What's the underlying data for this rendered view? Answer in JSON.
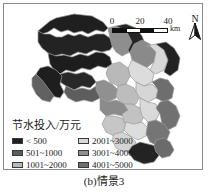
{
  "figure": {
    "caption": "(b)情景3"
  },
  "scalebar": {
    "ticks": [
      "0",
      "20",
      "40"
    ],
    "unit": "km",
    "segments": [
      "on",
      "off",
      "on",
      "off"
    ]
  },
  "north_arrow": {
    "letter": "N",
    "icon": "north-arrow-icon"
  },
  "legend": {
    "title": "节水投入/万元",
    "items": [
      {
        "label": "< 500",
        "color": "#201f1f"
      },
      {
        "label": "501~1000",
        "color": "#5d5d5d"
      },
      {
        "label": "1001~2000",
        "color": "#b9b9b9"
      },
      {
        "label": "2001~3000",
        "color": "#d8d8d8"
      },
      {
        "label": "3001~4000",
        "color": "#8e8e8e"
      },
      {
        "label": "4001~5000",
        "color": "#6e6e6e"
      }
    ]
  },
  "map": {
    "name": "water-saving-investment-choropleth",
    "outline_color": "#9a9a9a",
    "regions": [
      {
        "id": "r1",
        "class": "< 500",
        "fill": "#201f1f",
        "points": "52,14 70,10 88,12 99,18 104,24 100,28 92,26 84,30 78,27 70,29 64,26 57,28 50,24 44,28 38,30 34,27 40,22 46,17"
      },
      {
        "id": "r2",
        "class": "< 500",
        "fill": "#242323",
        "points": "34,27 40,30 46,30 52,33 58,33 64,30 70,32 76,30 84,33 92,30 100,30 106,34 110,40 106,46 98,48 90,46 82,50 74,48 66,52 58,50 50,52 44,49 38,44 34,38"
      },
      {
        "id": "r3",
        "class": "< 500",
        "fill": "#1e1d1d",
        "points": "44,49 52,52 60,51 68,53 76,50 84,52 92,48 100,49 106,53 108,60 102,64 94,62 86,66 78,64 70,68 62,66 56,70 50,66 46,60"
      },
      {
        "id": "r4",
        "class": "3001~4000",
        "fill": "#8e8e8e",
        "points": "104,24 112,22 120,26 126,32 130,40 126,48 118,52 112,48 108,42 106,34"
      },
      {
        "id": "r5",
        "class": "< 500",
        "fill": "#262525",
        "points": "112,22 122,20 132,24 138,32 142,42 136,50 128,52 124,46 128,38 124,30 118,25"
      },
      {
        "id": "r6",
        "class": "3001~4000",
        "fill": "#8a8a8a",
        "points": "130,40 138,36 146,40 152,48 150,58 142,64 134,62 128,56 126,48"
      },
      {
        "id": "r7",
        "class": "2001~3000",
        "fill": "#d8d8d8",
        "points": "142,42 152,40 160,46 164,56 160,66 152,70 146,66 150,58 152,48 146,42"
      },
      {
        "id": "r8",
        "class": "< 500",
        "fill": "#232222",
        "points": "152,40 162,38 170,44 176,54 174,66 166,72 160,68 164,56 160,46"
      },
      {
        "id": "r9",
        "class": "2001~3000",
        "fill": "#dcdcdc",
        "points": "128,56 136,60 144,64 150,70 148,78 140,82 132,78 126,72 124,64"
      },
      {
        "id": "r10",
        "class": "1001~2000",
        "fill": "#b9b9b9",
        "points": "108,60 116,58 124,64 126,72 122,80 114,82 106,78 102,70 104,64"
      },
      {
        "id": "r11",
        "class": "< 500",
        "fill": "#292828",
        "points": "56,70 64,68 72,70 80,68 88,72 92,78 86,84 78,82 70,86 62,82 56,78"
      },
      {
        "id": "r12",
        "class": "501~1000",
        "fill": "#5d5d5d",
        "points": "62,82 70,86 78,84 86,86 92,82 98,86 96,94 88,98 80,96 72,98 64,94 60,88"
      },
      {
        "id": "r13",
        "class": "< 500",
        "fill": "#1f1e1e",
        "points": "36,64 44,62 52,66 58,72 56,80 60,88 56,94 48,92 42,86 36,78 32,70"
      },
      {
        "id": "r14",
        "class": "501~1000",
        "fill": "#616161",
        "points": "32,70 38,76 44,84 50,92 46,98 38,96 32,90 28,82 28,74"
      },
      {
        "id": "r15",
        "class": "3001~4000",
        "fill": "#909090",
        "points": "92,78 100,76 108,80 114,86 112,94 104,98 96,94 92,86"
      },
      {
        "id": "r16",
        "class": "1001~2000",
        "fill": "#bdbdbd",
        "points": "114,82 122,80 130,84 136,92 132,100 124,102 116,98 112,92"
      },
      {
        "id": "r17",
        "class": "2001~3000",
        "fill": "#d6d6d6",
        "points": "132,78 140,82 148,80 154,86 152,94 144,98 136,94 132,88"
      },
      {
        "id": "r18",
        "class": "4001~5000",
        "fill": "#6e6e6e",
        "points": "148,78 156,74 164,76 170,84 168,94 160,98 152,94 154,86 150,80"
      },
      {
        "id": "r19",
        "class": "3001~4000",
        "fill": "#8b8b8b",
        "points": "96,94 104,98 112,96 120,100 124,106 118,112 110,110 102,112 96,106"
      },
      {
        "id": "r20",
        "class": "1001~2000",
        "fill": "#c2c2c2",
        "points": "120,100 128,100 136,104 140,112 136,120 128,122 120,118 118,110 124,106"
      },
      {
        "id": "r21",
        "class": "2001~3000",
        "fill": "#dadada",
        "points": "136,94 144,98 152,100 156,108 152,116 144,118 138,112 136,104"
      },
      {
        "id": "r22",
        "class": "4001~5000",
        "fill": "#717171",
        "points": "156,98 164,96 172,102 176,112 172,122 164,126 158,120 156,110 152,104"
      },
      {
        "id": "r23",
        "class": "1001~2000",
        "fill": "#c6c6c6",
        "points": "102,112 110,112 118,114 122,122 118,130 110,132 102,128 98,120"
      },
      {
        "id": "r24",
        "class": "2001~3000",
        "fill": "#dddddd",
        "points": "122,118 130,120 138,118 144,124 142,132 134,136 126,132 120,126"
      },
      {
        "id": "r25",
        "class": "4001~5000",
        "fill": "#757575",
        "points": "144,118 152,116 160,120 166,128 162,138 154,142 146,138 142,130"
      },
      {
        "id": "r26",
        "class": "2001~3000",
        "fill": "#d4d4d4",
        "points": "110,130 118,128 126,132 132,138 128,146 120,148 112,144 108,136"
      },
      {
        "id": "r27",
        "class": "< 500",
        "fill": "#232323",
        "points": "128,142 136,138 144,140 152,142 156,150 150,158 140,160 130,156 124,148"
      },
      {
        "id": "r28",
        "class": "4001~5000",
        "fill": "#6b6b6b",
        "points": "152,136 160,134 166,138 170,146 166,152 158,154 152,148 150,142"
      }
    ]
  }
}
